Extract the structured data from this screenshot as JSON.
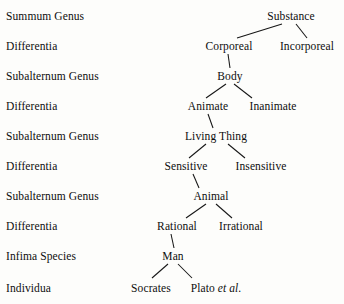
{
  "diagram": {
    "row_labels": [
      {
        "text": "Summum Genus",
        "x": 6,
        "y": 10
      },
      {
        "text": "Differentia",
        "x": 6,
        "y": 40
      },
      {
        "text": "Subalternum Genus",
        "x": 6,
        "y": 70
      },
      {
        "text": "Differentia",
        "x": 6,
        "y": 100
      },
      {
        "text": "Subalternum Genus",
        "x": 6,
        "y": 130
      },
      {
        "text": "Differentia",
        "x": 6,
        "y": 160
      },
      {
        "text": "Subalternum Genus",
        "x": 6,
        "y": 190
      },
      {
        "text": "Differentia",
        "x": 6,
        "y": 220
      },
      {
        "text": "Infima Species",
        "x": 6,
        "y": 250
      },
      {
        "text": "Individua",
        "x": 6,
        "y": 282
      }
    ],
    "nodes": [
      {
        "id": "substance",
        "text": "Substance",
        "cx": 291,
        "y": 10
      },
      {
        "id": "corporeal",
        "text": "Corporeal",
        "cx": 229,
        "y": 40
      },
      {
        "id": "incorporeal",
        "text": "Incorporeal",
        "cx": 307,
        "y": 40
      },
      {
        "id": "body",
        "text": "Body",
        "cx": 230,
        "y": 70
      },
      {
        "id": "animate",
        "text": "Animate",
        "cx": 208,
        "y": 100
      },
      {
        "id": "inanimate",
        "text": "Inanimate",
        "cx": 273,
        "y": 100
      },
      {
        "id": "living-thing",
        "text": "Living Thing",
        "cx": 216,
        "y": 130
      },
      {
        "id": "sensitive",
        "text": "Sensitive",
        "cx": 186,
        "y": 160
      },
      {
        "id": "insensitive",
        "text": "Insensitive",
        "cx": 261,
        "y": 160
      },
      {
        "id": "animal",
        "text": "Animal",
        "cx": 211,
        "y": 190
      },
      {
        "id": "rational",
        "text": "Rational",
        "cx": 177,
        "y": 220
      },
      {
        "id": "irrational",
        "text": "Irrational",
        "cx": 241,
        "y": 220
      },
      {
        "id": "man",
        "text": "Man",
        "cx": 173,
        "y": 250
      },
      {
        "id": "socrates",
        "text": "Socrates",
        "cx": 151,
        "y": 282
      },
      {
        "id": "plato",
        "text": "Plato ",
        "italic": "et al.",
        "cx": 216,
        "y": 282
      }
    ],
    "edges": [
      {
        "from": "substance",
        "to": "corporeal",
        "x1": 282,
        "y1": 24,
        "x2": 237,
        "y2": 38
      },
      {
        "from": "substance",
        "to": "incorporeal",
        "x1": 296,
        "y1": 24,
        "x2": 307,
        "y2": 38
      },
      {
        "from": "corporeal",
        "to": "body",
        "x1": 228,
        "y1": 54,
        "x2": 230,
        "y2": 68
      },
      {
        "from": "body",
        "to": "animate",
        "x1": 226,
        "y1": 84,
        "x2": 206,
        "y2": 98
      },
      {
        "from": "body",
        "to": "inanimate",
        "x1": 234,
        "y1": 84,
        "x2": 252,
        "y2": 98
      },
      {
        "from": "animate",
        "to": "living-thing",
        "x1": 208,
        "y1": 114,
        "x2": 213,
        "y2": 128
      },
      {
        "from": "living-thing",
        "to": "sensitive",
        "x1": 206,
        "y1": 144,
        "x2": 189,
        "y2": 158
      },
      {
        "from": "living-thing",
        "to": "insensitive",
        "x1": 228,
        "y1": 144,
        "x2": 245,
        "y2": 158
      },
      {
        "from": "sensitive",
        "to": "animal",
        "x1": 193,
        "y1": 174,
        "x2": 199,
        "y2": 188
      },
      {
        "from": "animal",
        "to": "rational",
        "x1": 206,
        "y1": 204,
        "x2": 186,
        "y2": 218
      },
      {
        "from": "animal",
        "to": "irrational",
        "x1": 216,
        "y1": 204,
        "x2": 232,
        "y2": 218
      },
      {
        "from": "rational",
        "to": "man",
        "x1": 171,
        "y1": 234,
        "x2": 174,
        "y2": 248
      },
      {
        "from": "man",
        "to": "socrates",
        "x1": 168,
        "y1": 264,
        "x2": 152,
        "y2": 278
      },
      {
        "from": "man",
        "to": "plato",
        "x1": 178,
        "y1": 264,
        "x2": 192,
        "y2": 278
      }
    ],
    "colors": {
      "background": "#fdfdfb",
      "text": "#0e0e0e",
      "line": "#161616"
    }
  }
}
